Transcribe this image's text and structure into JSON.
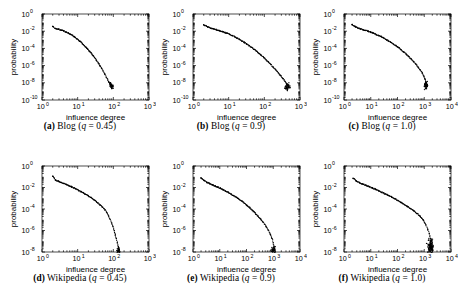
{
  "figure": {
    "title": "",
    "background": "#ffffff",
    "marker_color": "#000000",
    "axis_color": "#000000",
    "rows": 2,
    "cols": 3
  },
  "chart_data": [
    {
      "type": "scatter",
      "panel": "a",
      "caption_label": "(a)",
      "caption_name": "Blog",
      "caption_param": "q",
      "caption_value": "= 0.45",
      "caption_full": "(a) Blog (q = 0.45)",
      "title": "",
      "xlabel": "influence degree",
      "ylabel": "probability",
      "xscale": "log",
      "yscale": "log",
      "xlim": [
        1,
        1000
      ],
      "ylim": [
        1e-10,
        1
      ],
      "xticks": [
        "10^0",
        "10^1",
        "10^2",
        "10^3"
      ],
      "xtick_exponents": [
        0,
        1,
        2,
        3
      ],
      "yticks": [
        "10^0",
        "10^-2",
        "10^-4",
        "10^-6",
        "10^-8",
        "10^-10"
      ],
      "ytick_exponents": [
        0,
        -2,
        -4,
        -6,
        -8,
        -10
      ],
      "grid": false,
      "legend": "none",
      "points": [
        [
          2.0,
          0.035
        ],
        [
          2.4,
          0.02
        ],
        [
          2.9,
          0.017
        ],
        [
          3.4,
          0.014
        ],
        [
          4.0,
          0.011
        ],
        [
          4.7,
          0.0082
        ],
        [
          5.5,
          0.0062
        ],
        [
          6.3,
          0.0045
        ],
        [
          7.2,
          0.0031
        ],
        [
          8.2,
          0.0021
        ],
        [
          9.3,
          0.0014
        ],
        [
          10.5,
          0.00092
        ],
        [
          12.0,
          0.0006
        ],
        [
          13.5,
          0.00037
        ],
        [
          15.2,
          0.00023
        ],
        [
          17.0,
          0.00014
        ],
        [
          19.0,
          8.2e-05
        ],
        [
          21.5,
          4.8e-05
        ],
        [
          24.0,
          2.7e-05
        ],
        [
          27.0,
          1.5e-05
        ],
        [
          30.0,
          8e-06
        ],
        [
          33.5,
          4.2e-06
        ],
        [
          37.5,
          2.1e-06
        ],
        [
          42.0,
          1.05e-06
        ],
        [
          47.0,
          5e-07
        ],
        [
          52.0,
          2.3e-07
        ],
        [
          58.0,
          1e-07
        ],
        [
          64.0,
          4.5e-08
        ],
        [
          70.0,
          2e-08
        ],
        [
          76.0,
          1.1e-08
        ],
        [
          81.0,
          7e-09
        ],
        [
          85.0,
          5.5e-09
        ],
        [
          88.0,
          4.5e-09
        ],
        [
          90.0,
          4e-09
        ],
        [
          93.0,
          3.8e-09
        ],
        [
          96.0,
          3.6e-09
        ]
      ],
      "scatter_tail": {
        "x_center": 88,
        "x_spread": 0.06,
        "y_center": 5e-09,
        "y_spread": 0.35,
        "count": 40
      }
    },
    {
      "type": "scatter",
      "panel": "b",
      "caption_label": "(b)",
      "caption_name": "Blog",
      "caption_param": "q",
      "caption_value": "= 0.9",
      "caption_full": "(b) Blog (q = 0.9)",
      "title": "",
      "xlabel": "influence degree",
      "ylabel": "probability",
      "xscale": "log",
      "yscale": "log",
      "xlim": [
        1,
        1000
      ],
      "ylim": [
        1e-10,
        1
      ],
      "xticks": [
        "10^0",
        "10^1",
        "10^2",
        "10^3"
      ],
      "xtick_exponents": [
        0,
        1,
        2,
        3
      ],
      "yticks": [
        "10^0",
        "10^-2",
        "10^-4",
        "10^-6",
        "10^-8",
        "10^-10"
      ],
      "ytick_exponents": [
        0,
        -2,
        -4,
        -6,
        -8,
        -10
      ],
      "grid": false,
      "legend": "none",
      "points": [
        [
          2.0,
          0.055
        ],
        [
          2.6,
          0.03
        ],
        [
          3.2,
          0.022
        ],
        [
          3.9,
          0.018
        ],
        [
          4.7,
          0.014
        ],
        [
          5.6,
          0.011
        ],
        [
          6.6,
          0.009
        ],
        [
          7.8,
          0.0072
        ],
        [
          9.2,
          0.0056
        ],
        [
          10.8,
          0.0042
        ],
        [
          12.6,
          0.0031
        ],
        [
          14.8,
          0.0023
        ],
        [
          17.2,
          0.0016
        ],
        [
          20.0,
          0.0011
        ],
        [
          23.5,
          0.00075
        ],
        [
          27.5,
          0.0005
        ],
        [
          32.0,
          0.00033
        ],
        [
          37.5,
          0.00021
        ],
        [
          44.0,
          0.00013
        ],
        [
          51.0,
          8e-05
        ],
        [
          60.0,
          4.8e-05
        ],
        [
          70.0,
          2.8e-05
        ],
        [
          82.0,
          1.6e-05
        ],
        [
          96.0,
          8.8e-06
        ],
        [
          112.0,
          4.8e-06
        ],
        [
          131.0,
          2.5e-06
        ],
        [
          153.0,
          1.3e-06
        ],
        [
          179.0,
          6.5e-07
        ],
        [
          209.0,
          3.2e-07
        ],
        [
          244.0,
          1.5e-07
        ],
        [
          285.0,
          7e-08
        ],
        [
          330.0,
          3.2e-08
        ],
        [
          380.0,
          1.5e-08
        ],
        [
          420.0,
          8e-09
        ],
        [
          450.0,
          5e-09
        ],
        [
          475.0,
          3.5e-09
        ],
        [
          495.0,
          2.8e-09
        ]
      ],
      "scatter_tail": {
        "x_center": 450,
        "x_spread": 0.07,
        "y_center": 3.5e-09,
        "y_spread": 0.4,
        "count": 55
      }
    },
    {
      "type": "scatter",
      "panel": "c",
      "caption_label": "(c)",
      "caption_name": "Blog",
      "caption_param": "q",
      "caption_value": "= 1.0",
      "caption_full": "(c) Blog (q = 1.0)",
      "title": "",
      "xlabel": "influence degree",
      "ylabel": "probability",
      "xscale": "log",
      "yscale": "log",
      "xlim": [
        1,
        10000
      ],
      "ylim": [
        1e-10,
        1
      ],
      "xticks": [
        "10^0",
        "10^1",
        "10^2",
        "10^3",
        "10^4"
      ],
      "xtick_exponents": [
        0,
        1,
        2,
        3,
        4
      ],
      "yticks": [
        "10^0",
        "10^-2",
        "10^-4",
        "10^-6",
        "10^-8",
        "10^-10"
      ],
      "ytick_exponents": [
        0,
        -2,
        -4,
        -6,
        -8,
        -10
      ],
      "grid": false,
      "legend": "none",
      "points": [
        [
          2.0,
          0.06
        ],
        [
          2.6,
          0.035
        ],
        [
          3.3,
          0.024
        ],
        [
          4.2,
          0.019
        ],
        [
          5.2,
          0.015
        ],
        [
          6.5,
          0.012
        ],
        [
          8.0,
          0.0098
        ],
        [
          10.0,
          0.0078
        ],
        [
          12.5,
          0.006
        ],
        [
          15.5,
          0.0045
        ],
        [
          19.0,
          0.0033
        ],
        [
          24.0,
          0.0024
        ],
        [
          30.0,
          0.0017
        ],
        [
          37.0,
          0.0011
        ],
        [
          46.0,
          0.00075
        ],
        [
          57.0,
          0.0005
        ],
        [
          71.0,
          0.00032
        ],
        [
          88.0,
          0.0002
        ],
        [
          110.0,
          0.00012
        ],
        [
          136.0,
          7e-05
        ],
        [
          168.0,
          4e-05
        ],
        [
          208.0,
          2.2e-05
        ],
        [
          258.0,
          1.2e-05
        ],
        [
          320.0,
          6e-06
        ],
        [
          396.0,
          3e-06
        ],
        [
          490.0,
          1.4e-06
        ],
        [
          600.0,
          6.5e-07
        ],
        [
          720.0,
          3e-07
        ],
        [
          850.0,
          1.3e-07
        ],
        [
          980.0,
          5.5e-08
        ],
        [
          1080.0,
          2.6e-08
        ],
        [
          1160.0,
          1.3e-08
        ],
        [
          1220.0,
          7.5e-09
        ],
        [
          1270.0,
          4.8e-09
        ],
        [
          1310.0,
          3.6e-09
        ]
      ],
      "scatter_tail": {
        "x_center": 1150,
        "x_spread": 0.06,
        "y_center": 5e-09,
        "y_spread": 0.42,
        "count": 50
      }
    },
    {
      "type": "scatter",
      "panel": "d",
      "caption_label": "(d)",
      "caption_name": "Wikipedia",
      "caption_param": "q",
      "caption_value": "= 0.45",
      "caption_full": "(d) Wikipedia (q = 0.45)",
      "title": "",
      "xlabel": "influence degree",
      "ylabel": "probability",
      "xscale": "log",
      "yscale": "log",
      "xlim": [
        1,
        1000
      ],
      "ylim": [
        1e-08,
        1
      ],
      "xticks": [
        "10^0",
        "10^1",
        "10^2",
        "10^3"
      ],
      "xtick_exponents": [
        0,
        1,
        2,
        3
      ],
      "yticks": [
        "10^0",
        "10^-2",
        "10^-4",
        "10^-6",
        "10^-8"
      ],
      "ytick_exponents": [
        0,
        -2,
        -4,
        -6,
        -8
      ],
      "grid": false,
      "legend": "none",
      "points": [
        [
          2.0,
          0.11
        ],
        [
          2.4,
          0.05
        ],
        [
          2.9,
          0.038
        ],
        [
          3.4,
          0.03
        ],
        [
          4.0,
          0.024
        ],
        [
          4.8,
          0.019
        ],
        [
          5.6,
          0.015
        ],
        [
          6.6,
          0.012
        ],
        [
          7.7,
          0.0093
        ],
        [
          9.0,
          0.0072
        ],
        [
          10.5,
          0.0055
        ],
        [
          12.3,
          0.0042
        ],
        [
          14.4,
          0.0031
        ],
        [
          16.8,
          0.0023
        ],
        [
          19.6,
          0.0017
        ],
        [
          23.0,
          0.0012
        ],
        [
          26.8,
          0.00083
        ],
        [
          31.3,
          0.00057
        ],
        [
          36.6,
          0.00038
        ],
        [
          42.8,
          0.00024
        ],
        [
          50.0,
          0.00015
        ],
        [
          58.0,
          8.5e-05
        ],
        [
          66.0,
          4.5e-05
        ],
        [
          74.0,
          2.3e-05
        ],
        [
          82.0,
          1.1e-05
        ],
        [
          90.0,
          5e-06
        ],
        [
          98.0,
          2.2e-06
        ],
        [
          106.0,
          9.5e-07
        ],
        [
          114.0,
          4e-07
        ],
        [
          122.0,
          1.7e-07
        ],
        [
          130.0,
          7e-08
        ],
        [
          138.0,
          3.2e-08
        ],
        [
          145.0,
          1.6e-08
        ],
        [
          152.0,
          1e-08
        ]
      ],
      "scatter_tail": {
        "x_center": 140,
        "x_spread": 0.05,
        "y_center": 1.3e-08,
        "y_spread": 0.3,
        "count": 30
      }
    },
    {
      "type": "scatter",
      "panel": "e",
      "caption_label": "(e)",
      "caption_name": "Wikipedia",
      "caption_param": "q",
      "caption_value": "= 0.9",
      "caption_full": "(e) Wikipedia (q = 0.9)",
      "title": "",
      "xlabel": "influence degree",
      "ylabel": "probability",
      "xscale": "log",
      "yscale": "log",
      "xlim": [
        1,
        10000
      ],
      "ylim": [
        1e-08,
        1
      ],
      "xticks": [
        "10^0",
        "10^1",
        "10^2",
        "10^3",
        "10^4"
      ],
      "xtick_exponents": [
        0,
        1,
        2,
        3,
        4
      ],
      "yticks": [
        "10^0",
        "10^-2",
        "10^-4",
        "10^-6",
        "10^-8"
      ],
      "ytick_exponents": [
        0,
        -2,
        -4,
        -6,
        -8
      ],
      "grid": false,
      "legend": "none",
      "points": [
        [
          2.0,
          0.08
        ],
        [
          2.6,
          0.045
        ],
        [
          3.3,
          0.03
        ],
        [
          4.2,
          0.023
        ],
        [
          5.3,
          0.018
        ],
        [
          6.7,
          0.014
        ],
        [
          8.4,
          0.011
        ],
        [
          10.6,
          0.0083
        ],
        [
          13.3,
          0.0062
        ],
        [
          16.8,
          0.0046
        ],
        [
          21.2,
          0.0034
        ],
        [
          26.6,
          0.0024
        ],
        [
          33.5,
          0.0017
        ],
        [
          42.2,
          0.0012
        ],
        [
          53.0,
          0.0008
        ],
        [
          67.0,
          0.00053
        ],
        [
          84.0,
          0.00034
        ],
        [
          106.0,
          0.00021
        ],
        [
          133.0,
          0.00013
        ],
        [
          168.0,
          7.5e-05
        ],
        [
          211.0,
          4.2e-05
        ],
        [
          266.0,
          2.3e-05
        ],
        [
          334.0,
          1.2e-05
        ],
        [
          420.0,
          5.8e-06
        ],
        [
          530.0,
          2.6e-06
        ],
        [
          650.0,
          1.1e-06
        ],
        [
          780.0,
          4.5e-07
        ],
        [
          900.0,
          1.8e-07
        ],
        [
          1000.0,
          7e-08
        ],
        [
          1080.0,
          3e-08
        ],
        [
          1150.0,
          1.5e-08
        ],
        [
          1200.0,
          1e-08
        ]
      ],
      "scatter_tail": {
        "x_center": 1000,
        "x_spread": 0.07,
        "y_center": 1.4e-08,
        "y_spread": 0.35,
        "count": 45
      }
    },
    {
      "type": "scatter",
      "panel": "f",
      "caption_label": "(f)",
      "caption_name": "Wikipedia",
      "caption_param": "q",
      "caption_value": "= 1.0",
      "caption_full": "(f) Wikipedia (q = 1.0)",
      "title": "",
      "xlabel": "influence degree",
      "ylabel": "probability",
      "xscale": "log",
      "yscale": "log",
      "xlim": [
        1,
        10000
      ],
      "ylim": [
        1e-08,
        1
      ],
      "xticks": [
        "10^0",
        "10^1",
        "10^2",
        "10^3",
        "10^4"
      ],
      "xtick_exponents": [
        0,
        1,
        2,
        3,
        4
      ],
      "yticks": [
        "10^0",
        "10^-2",
        "10^-4",
        "10^-6",
        "10^-8"
      ],
      "ytick_exponents": [
        0,
        -2,
        -4,
        -6,
        -8
      ],
      "grid": false,
      "legend": "none",
      "points": [
        [
          2.2,
          0.07
        ],
        [
          2.9,
          0.04
        ],
        [
          3.8,
          0.028
        ],
        [
          5.0,
          0.021
        ],
        [
          6.6,
          0.016
        ],
        [
          8.7,
          0.012
        ],
        [
          11.5,
          0.0092
        ],
        [
          15.1,
          0.0068
        ],
        [
          19.9,
          0.005
        ],
        [
          26.2,
          0.0036
        ],
        [
          34.5,
          0.0026
        ],
        [
          45.5,
          0.0018
        ],
        [
          60.0,
          0.0013
        ],
        [
          79.0,
          0.0009
        ],
        [
          104.0,
          0.0006
        ],
        [
          137.0,
          0.0004
        ],
        [
          180.0,
          0.00026
        ],
        [
          237.0,
          0.00017
        ],
        [
          312.0,
          0.00011
        ],
        [
          411.0,
          6.5e-05
        ],
        [
          541.0,
          3.8e-05
        ],
        [
          713.0,
          2e-05
        ],
        [
          939.0,
          9e-06
        ],
        [
          1150.0,
          3.5e-06
        ],
        [
          1350.0,
          1.3e-06
        ],
        [
          1550.0,
          5e-07
        ],
        [
          1700.0,
          1.8e-07
        ],
        [
          1850.0,
          6e-08
        ],
        [
          1950.0,
          2e-08
        ],
        [
          2050.0,
          1e-08
        ]
      ],
      "scatter_tail": {
        "x_center": 1700,
        "x_spread": 0.1,
        "y_center": 3.5e-08,
        "y_spread": 0.65,
        "count": 130
      }
    }
  ]
}
